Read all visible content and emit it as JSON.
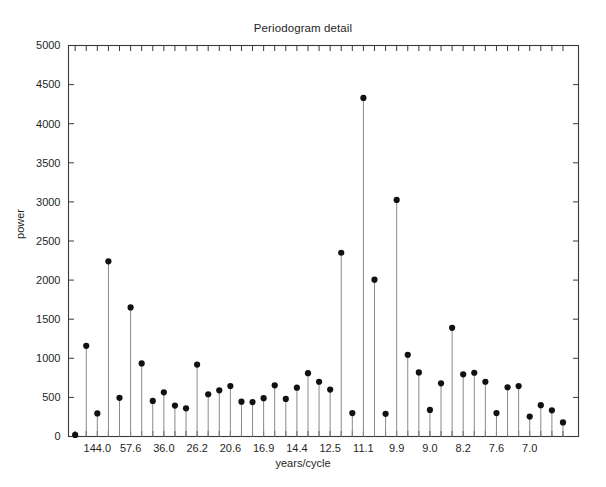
{
  "chart_data": {
    "type": "line",
    "plot_style": "stem",
    "title": "Periodogram detail",
    "xlabel": "years/cycle",
    "ylabel": "power",
    "ylim": [
      0,
      5000
    ],
    "yticks": [
      0,
      500,
      1000,
      1500,
      2000,
      2500,
      3000,
      3500,
      4000,
      4500,
      5000
    ],
    "ytick_labels": [
      "0",
      "500",
      "1000",
      "1500",
      "2000",
      "2500",
      "3000",
      "3500",
      "4000",
      "4500",
      "5000"
    ],
    "xtick_labels": [
      "144.0",
      "57.6",
      "36.0",
      "26.2",
      "20.6",
      "16.9",
      "14.4",
      "12.5",
      "11.1",
      "9.9",
      "9.0",
      "8.2",
      "7.6",
      "7.0"
    ],
    "xtick_indices": [
      2,
      5,
      8,
      11,
      14,
      17,
      20,
      23,
      26,
      29,
      32,
      35,
      38,
      41
    ],
    "n_points": 44,
    "grid": false,
    "legend": false,
    "marker": "filled-circle",
    "marker_color": "#111111",
    "stem_color": "#8a8a8a",
    "axis_color": "#3a3a3a",
    "values": [
      20,
      1160,
      295,
      2240,
      495,
      1650,
      935,
      455,
      565,
      395,
      360,
      920,
      540,
      590,
      645,
      445,
      440,
      490,
      655,
      480,
      625,
      810,
      700,
      600,
      2350,
      300,
      4330,
      2005,
      290,
      3025,
      1045,
      820,
      340,
      680,
      1390,
      795,
      815,
      700,
      300,
      630,
      645,
      255,
      400,
      335,
      180
    ],
    "peaks": [
      {
        "label": "11.1",
        "value": 4330
      },
      {
        "label": "9.9",
        "value": 3025
      },
      {
        "label": "12.5",
        "value": 2350
      },
      {
        "label": "144.0",
        "value": 2240
      },
      {
        "label": "11.1-adj",
        "value": 2005
      }
    ]
  },
  "figure": {
    "background_color": "#ffffff"
  }
}
